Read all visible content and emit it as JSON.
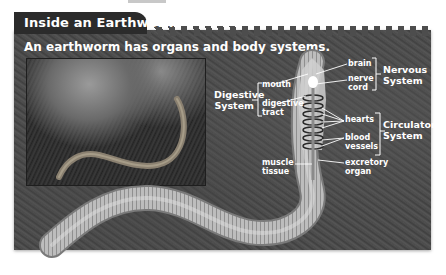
{
  "figure": {
    "title": "Inside an Earthworm",
    "subtitle": "An earthworm has organs and body systems."
  },
  "labels": {
    "organs": {
      "brain": "brain",
      "nerve_cord": "nerve cord",
      "mouth": "mouth",
      "digestive_tract": "digestive tract",
      "hearts": "hearts",
      "blood_vessels": "blood vessels",
      "muscle_tissue": "muscle tissue",
      "excretory_organ": "excretory organ"
    },
    "systems": {
      "nervous": "Nervous System",
      "digestive": "Digestive System",
      "circulatory": "Circulatory System"
    }
  },
  "colors": {
    "title_tab": "#2b2b2b",
    "panel": "#4d4d4d",
    "label_text": "#ffffff"
  }
}
